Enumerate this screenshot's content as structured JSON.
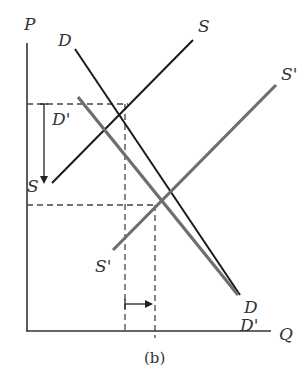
{
  "diagram": {
    "caption": "(b)",
    "axes": {
      "y_label": "P",
      "x_label": "Q"
    },
    "curves": [
      {
        "id": "D",
        "label": "D",
        "end_label": "D",
        "color": "#1a1a1a",
        "type": "demand-original"
      },
      {
        "id": "S",
        "label": "S",
        "end_label": "S",
        "color": "#1a1a1a",
        "type": "supply-original"
      },
      {
        "id": "D_prime",
        "label": "D'",
        "end_label": "D'",
        "color": "#6e6e6e",
        "type": "demand-shifted"
      },
      {
        "id": "S_prime",
        "label": "S'",
        "end_label": "S'",
        "color": "#6e6e6e",
        "type": "supply-shifted"
      }
    ],
    "annotations": {
      "price_change": "down arrow from original equilibrium price to new equilibrium price",
      "quantity_change": "right arrow from original equilibrium quantity to new equilibrium quantity"
    },
    "colors": {
      "original": "#1a1a1a",
      "shifted": "#6e6e6e",
      "guide": "#444444"
    }
  }
}
